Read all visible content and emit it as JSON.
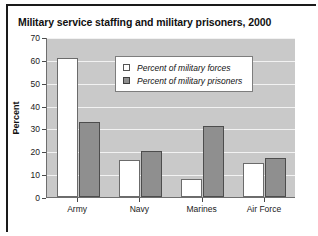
{
  "figure": {
    "title": "Military service staffing and military prisoners, 2000",
    "border_color": "#1a1a1a",
    "plot_background": "#c9c9c9"
  },
  "chart_data": {
    "type": "bar",
    "title": "Military service staffing and military prisoners, 2000",
    "xlabel": "",
    "ylabel": "Percent",
    "ylim": [
      0,
      70
    ],
    "ytick_step": 10,
    "yticks": [
      0,
      10,
      20,
      30,
      40,
      50,
      60,
      70
    ],
    "grid": true,
    "legend_position": "upper center",
    "categories": [
      "Army",
      "Navy",
      "Marines",
      "Air Force"
    ],
    "series": [
      {
        "name": "Percent of military forces",
        "color": "#ffffff",
        "edge_color": "#6b6b6b",
        "values": [
          61,
          16,
          8,
          15
        ]
      },
      {
        "name": "Percent of military prisoners",
        "color": "#8f8f8f",
        "edge_color": "#4d4d4d",
        "values": [
          33,
          20,
          31,
          17
        ]
      }
    ]
  }
}
